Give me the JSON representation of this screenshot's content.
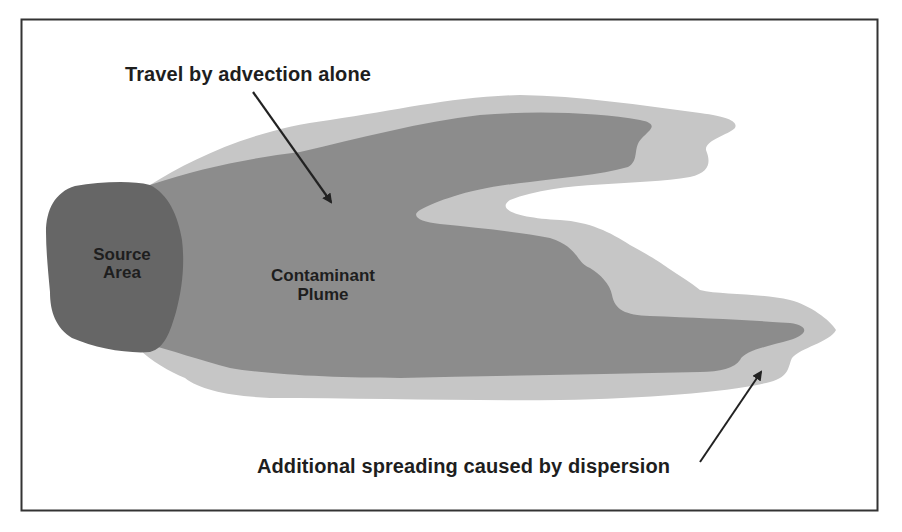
{
  "diagram": {
    "type": "conceptual-illustration",
    "regions": [
      {
        "id": "source-area",
        "label_lines": [
          "Source",
          "Area"
        ],
        "fill": "#666666"
      },
      {
        "id": "contaminant-plume",
        "label_lines": [
          "Contaminant",
          "Plume"
        ],
        "fill": "#8c8c8c"
      },
      {
        "id": "dispersion-halo",
        "label_lines": [],
        "fill": "#c6c6c6"
      }
    ],
    "annotations": [
      {
        "id": "advection",
        "text": "Travel by advection alone",
        "points_to": "contaminant-plume"
      },
      {
        "id": "dispersion",
        "text": "Additional spreading caused by dispersion",
        "points_to": "dispersion-halo"
      }
    ],
    "colors": {
      "frame": "#333333",
      "background": "#ffffff",
      "text": "#1e1e1e",
      "arrow": "#222222"
    }
  },
  "labels": {
    "advection": "Travel by advection alone",
    "dispersion": "Additional spreading caused by dispersion",
    "source_line1": "Source",
    "source_line2": "Area",
    "plume_line1": "Contaminant",
    "plume_line2": "Plume"
  }
}
